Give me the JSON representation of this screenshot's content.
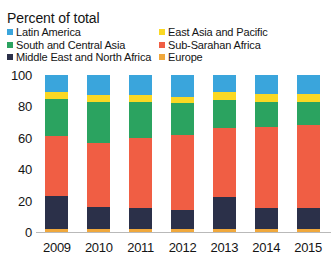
{
  "chart_data": {
    "type": "bar",
    "subtype": "stacked-bar-100",
    "title": "Percent of total",
    "xlabel": "",
    "ylabel": "",
    "ylim": [
      0,
      100
    ],
    "yticks": [
      0,
      20,
      40,
      60,
      80,
      100
    ],
    "grid": false,
    "legend_position": "top",
    "legend_columns": 2,
    "categories": [
      "2009",
      "2010",
      "2011",
      "2012",
      "2013",
      "2014",
      "2015"
    ],
    "stack_order_bottom_to_top": [
      "Europe",
      "Middle East and North Africa",
      "Sub-Saharan Africa",
      "South and Central Asia",
      "East Asia and Pacific",
      "Latin America"
    ],
    "series": [
      {
        "name": "Europe",
        "color": "#f0a83c",
        "values": [
          2,
          2,
          2,
          2,
          2,
          2,
          2
        ]
      },
      {
        "name": "Middle East and North Africa",
        "color": "#2b3049",
        "values": [
          21,
          14,
          13,
          12,
          20,
          13,
          13
        ]
      },
      {
        "name": "Sub-Saharan Africa",
        "color": "#f05e44",
        "values": [
          38,
          41,
          45,
          48,
          44,
          52,
          53
        ]
      },
      {
        "name": "South and Central Asia",
        "color": "#2ba360",
        "values": [
          24,
          26,
          23,
          20,
          18,
          16,
          15
        ]
      },
      {
        "name": "East Asia and Pacific",
        "color": "#fad824",
        "values": [
          4,
          4,
          4,
          4,
          5,
          5,
          5
        ]
      },
      {
        "name": "Latin America",
        "color": "#3aa5dc",
        "values": [
          11,
          13,
          13,
          14,
          11,
          12,
          12
        ]
      }
    ]
  },
  "legend": {
    "rows": [
      {
        "left": {
          "label": "Latin America",
          "color": "#3aa5dc"
        },
        "right": {
          "label": "East Asia and Pacific",
          "color": "#fad824"
        }
      },
      {
        "left": {
          "label": "South and Central Asia",
          "color": "#2ba360"
        },
        "right": {
          "label": "Sub-Sarahan Africa",
          "color": "#f05e44"
        }
      },
      {
        "left": {
          "label": "Middle East and North Africa",
          "color": "#2b3049"
        },
        "right": {
          "label": "Europe",
          "color": "#f0a83c"
        }
      }
    ]
  }
}
